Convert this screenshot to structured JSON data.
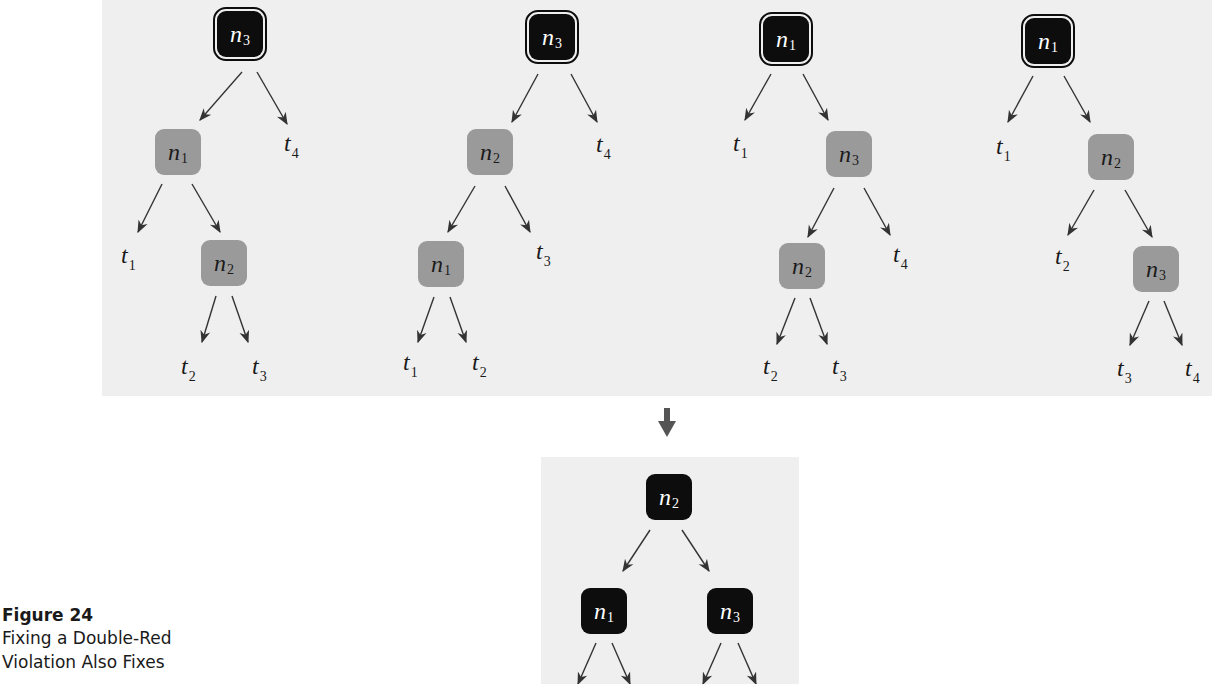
{
  "caption": {
    "title": "Figure 24",
    "lines": [
      "Fixing a Double-Red",
      "Violation Also Fixes"
    ]
  },
  "colors": {
    "panel_bg": "#efefef",
    "black_node": "#0d0d0d",
    "red_node": "#9a9a9a",
    "arrow": "#333333",
    "transition_arrow": "#555555"
  },
  "trees": [
    {
      "id": "case-a",
      "nodes": [
        {
          "name": "n",
          "sub": "3",
          "color": "black",
          "double": true,
          "x": 217,
          "y": 11
        },
        {
          "name": "n",
          "sub": "1",
          "color": "red",
          "double": false,
          "x": 155,
          "y": 129
        },
        {
          "name": "n",
          "sub": "2",
          "color": "red",
          "double": false,
          "x": 201,
          "y": 240
        }
      ],
      "leaves": [
        {
          "name": "t",
          "sub": "4",
          "x": 284,
          "y": 131
        },
        {
          "name": "t",
          "sub": "1",
          "x": 121,
          "y": 243
        },
        {
          "name": "t",
          "sub": "2",
          "x": 181,
          "y": 354
        },
        {
          "name": "t",
          "sub": "3",
          "x": 252,
          "y": 354
        }
      ]
    },
    {
      "id": "case-b",
      "nodes": [
        {
          "name": "n",
          "sub": "3",
          "color": "black",
          "double": true,
          "x": 529,
          "y": 14
        },
        {
          "name": "n",
          "sub": "2",
          "color": "red",
          "double": false,
          "x": 467,
          "y": 129
        },
        {
          "name": "n",
          "sub": "1",
          "color": "red",
          "double": false,
          "x": 418,
          "y": 241
        }
      ],
      "leaves": [
        {
          "name": "t",
          "sub": "4",
          "x": 596,
          "y": 132
        },
        {
          "name": "t",
          "sub": "3",
          "x": 536,
          "y": 239
        },
        {
          "name": "t",
          "sub": "1",
          "x": 403,
          "y": 350
        },
        {
          "name": "t",
          "sub": "2",
          "x": 472,
          "y": 350
        }
      ]
    },
    {
      "id": "case-c",
      "nodes": [
        {
          "name": "n",
          "sub": "1",
          "color": "black",
          "double": true,
          "x": 763,
          "y": 16
        },
        {
          "name": "n",
          "sub": "3",
          "color": "red",
          "double": false,
          "x": 826,
          "y": 131
        },
        {
          "name": "n",
          "sub": "2",
          "color": "red",
          "double": false,
          "x": 779,
          "y": 243
        }
      ],
      "leaves": [
        {
          "name": "t",
          "sub": "1",
          "x": 733,
          "y": 131
        },
        {
          "name": "t",
          "sub": "4",
          "x": 893,
          "y": 242
        },
        {
          "name": "t",
          "sub": "2",
          "x": 763,
          "y": 354
        },
        {
          "name": "t",
          "sub": "3",
          "x": 832,
          "y": 354
        }
      ]
    },
    {
      "id": "case-d",
      "nodes": [
        {
          "name": "n",
          "sub": "1",
          "color": "black",
          "double": true,
          "x": 1025,
          "y": 18
        },
        {
          "name": "n",
          "sub": "2",
          "color": "red",
          "double": false,
          "x": 1088,
          "y": 134
        },
        {
          "name": "n",
          "sub": "3",
          "color": "red",
          "double": false,
          "x": 1133,
          "y": 246
        }
      ],
      "leaves": [
        {
          "name": "t",
          "sub": "1",
          "x": 996,
          "y": 134
        },
        {
          "name": "t",
          "sub": "2",
          "x": 1055,
          "y": 244
        },
        {
          "name": "t",
          "sub": "3",
          "x": 1117,
          "y": 356
        },
        {
          "name": "t",
          "sub": "4",
          "x": 1185,
          "y": 356
        }
      ]
    },
    {
      "id": "result",
      "nodes": [
        {
          "name": "n",
          "sub": "2",
          "color": "black",
          "double": false,
          "x": 646,
          "y": 474
        },
        {
          "name": "n",
          "sub": "1",
          "color": "black",
          "double": false,
          "x": 581,
          "y": 588
        },
        {
          "name": "n",
          "sub": "3",
          "color": "black",
          "double": false,
          "x": 707,
          "y": 588
        }
      ],
      "leaves": []
    }
  ],
  "edges": [
    [
      242,
      72,
      200,
      120
    ],
    [
      257,
      72,
      287,
      124
    ],
    [
      162,
      184,
      138,
      232
    ],
    [
      192,
      184,
      220,
      232
    ],
    [
      216,
      296,
      202,
      342
    ],
    [
      232,
      296,
      248,
      342
    ],
    [
      538,
      74,
      512,
      122
    ],
    [
      571,
      74,
      597,
      122
    ],
    [
      475,
      186,
      448,
      232
    ],
    [
      505,
      186,
      530,
      232
    ],
    [
      434,
      297,
      418,
      342
    ],
    [
      450,
      297,
      466,
      342
    ],
    [
      771,
      74,
      745,
      120
    ],
    [
      803,
      74,
      828,
      120
    ],
    [
      834,
      188,
      808,
      237
    ],
    [
      864,
      188,
      890,
      235
    ],
    [
      795,
      298,
      777,
      344
    ],
    [
      810,
      298,
      827,
      344
    ],
    [
      1033,
      76,
      1008,
      122
    ],
    [
      1064,
      76,
      1090,
      122
    ],
    [
      1094,
      190,
      1068,
      235
    ],
    [
      1125,
      190,
      1152,
      237
    ],
    [
      1149,
      301,
      1130,
      345
    ],
    [
      1164,
      301,
      1182,
      345
    ],
    [
      650,
      530,
      623,
      571
    ],
    [
      682,
      530,
      709,
      571
    ],
    [
      596,
      643,
      578,
      684
    ],
    [
      612,
      643,
      630,
      684
    ],
    [
      721,
      643,
      703,
      684
    ],
    [
      738,
      643,
      756,
      684
    ]
  ]
}
